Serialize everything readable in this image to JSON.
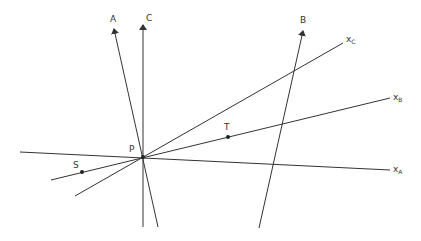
{
  "diagram": {
    "colors": {
      "line": "#333333",
      "background": "#ffffff"
    },
    "center": {
      "label": "P",
      "x": 143,
      "y": 157
    },
    "axes": [
      {
        "id": "A",
        "label": "A",
        "from": [
          158,
          227
        ],
        "to": [
          114,
          29
        ],
        "arrow": true,
        "label_pos": [
          110,
          22
        ]
      },
      {
        "id": "C",
        "label": "C",
        "from": [
          143,
          227
        ],
        "to": [
          143,
          25
        ],
        "arrow": true,
        "label_pos": [
          146,
          21
        ]
      },
      {
        "id": "B",
        "label": "B",
        "from": [
          259,
          228
        ],
        "to": [
          303,
          31
        ],
        "arrow": true,
        "label_pos": [
          300,
          23
        ]
      }
    ],
    "lines": [
      {
        "id": "xA",
        "label": "x",
        "sub": "A",
        "from": [
          20,
          152
        ],
        "to": [
          390,
          170
        ],
        "label_pos": [
          393,
          172
        ]
      },
      {
        "id": "xB",
        "label": "x",
        "sub": "B",
        "from": [
          51,
          180
        ],
        "to": [
          390,
          98
        ],
        "label_pos": [
          393,
          100
        ]
      },
      {
        "id": "xC",
        "label": "x",
        "sub": "C",
        "from": [
          75,
          196
        ],
        "to": [
          343,
          43
        ],
        "label_pos": [
          346,
          42
        ]
      }
    ],
    "points": [
      {
        "label": "P",
        "x": 143,
        "y": 157,
        "label_pos": [
          129,
          152
        ]
      },
      {
        "label": "S",
        "x": 82,
        "y": 172,
        "label_pos": [
          73,
          168
        ]
      },
      {
        "label": "T",
        "x": 228,
        "y": 137,
        "label_pos": [
          224,
          130
        ]
      }
    ]
  }
}
